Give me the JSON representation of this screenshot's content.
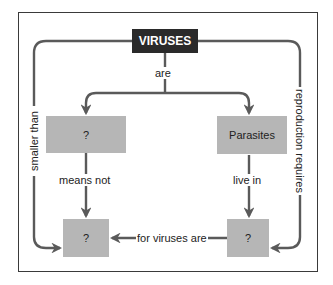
{
  "diagram": {
    "type": "concept-map",
    "colors": {
      "root_fill": "#2a2a2a",
      "root_text": "#ffffff",
      "node_fill": "#b6b6b6",
      "line": "#5a5a5a",
      "frame": "#3a3a3a"
    },
    "nodes": {
      "root": "VIRUSES",
      "top_left": "?",
      "top_right": "Parasites",
      "bottom_left": "?",
      "bottom_right": "?"
    },
    "links": {
      "are": "are",
      "smaller_than": "smaller than",
      "reproduction_requires": "reproduction requires",
      "means_not": "means not",
      "live_in": "live in",
      "for_viruses_are": "for viruses are"
    }
  }
}
